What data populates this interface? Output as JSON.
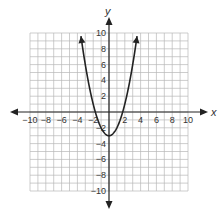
{
  "chart_data": {
    "type": "line",
    "title": "",
    "xlabel": "x",
    "ylabel": "y",
    "xlim": [
      -10,
      10
    ],
    "ylim": [
      -10,
      10
    ],
    "grid": true,
    "x_ticks": [
      -10,
      -8,
      -6,
      -4,
      -2,
      2,
      4,
      6,
      8,
      10
    ],
    "y_ticks": [
      10,
      8,
      6,
      4,
      2,
      -2,
      -4,
      -6,
      -8,
      -10
    ],
    "x_tick_labels": [
      "−10",
      "−8",
      "−6",
      "−4",
      "−2",
      "2",
      "4",
      "6",
      "8",
      "10"
    ],
    "y_tick_labels": [
      "10",
      "8",
      "6",
      "4",
      "2",
      "−2",
      "−4",
      "−6",
      "−8",
      "−10"
    ],
    "series": [
      {
        "name": "parabola",
        "equation": "y = x^2 - 3",
        "vertex": [
          0,
          -3
        ],
        "x": [
          -3.6,
          -3,
          -2,
          -1.7,
          -1,
          0,
          1,
          1.7,
          2,
          3,
          3.6
        ],
        "values": [
          9.96,
          6,
          1,
          -0.11,
          -2,
          -3,
          -2,
          -0.11,
          1,
          6,
          9.96
        ],
        "color": "#222222"
      }
    ]
  },
  "labels": {
    "x_axis": "x",
    "y_axis": "y"
  }
}
